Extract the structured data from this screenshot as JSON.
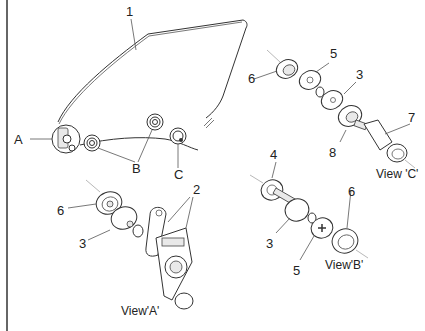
{
  "diagram": {
    "type": "exploded-parts-view",
    "callouts": {
      "c1": "1",
      "c2": "2",
      "c3a": "3",
      "c3b": "3",
      "c3c": "3",
      "c4": "4",
      "c5a": "5",
      "c5b": "5",
      "c6a": "6",
      "c6b": "6",
      "c6c": "6",
      "c7": "7",
      "c8": "8",
      "A": "A",
      "B": "B",
      "C": "C"
    },
    "views": {
      "a": "View'A'",
      "b": "View'B'",
      "c": "View 'C'"
    }
  }
}
